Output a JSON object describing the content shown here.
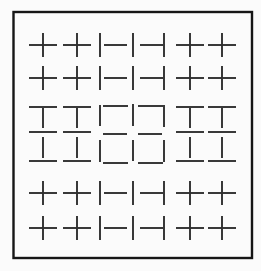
{
  "figure": {
    "background": "#fbfbfb",
    "ink": "#2f2f2f",
    "border": {
      "x": 13.5,
      "y": 12,
      "width": 238.5,
      "height": 246,
      "stroke": "#161616",
      "stroke_width": 2.4
    },
    "stroke_width": 1.9,
    "grid": {
      "rows": 6,
      "cols": 7
    },
    "cells": [
      {
        "id": "r1c1",
        "glyph": "cross",
        "strokes": [
          [
            29,
            45,
            57,
            45
          ],
          [
            43,
            33,
            43,
            57
          ]
        ]
      },
      {
        "id": "r1c2",
        "glyph": "cross",
        "strokes": [
          [
            63,
            45,
            91,
            45
          ],
          [
            77,
            33,
            77,
            57
          ]
        ]
      },
      {
        "id": "r1c3",
        "glyph": "vbar-hbar-right",
        "strokes": [
          [
            100,
            33,
            100,
            57
          ],
          [
            104,
            45,
            127,
            45
          ]
        ]
      },
      {
        "id": "r1c4",
        "glyph": "vbar",
        "strokes": [
          [
            133,
            33,
            133,
            57
          ]
        ]
      },
      {
        "id": "r1c5",
        "glyph": "hbar-vbar-right",
        "strokes": [
          [
            140,
            45,
            163,
            45
          ],
          [
            164,
            33,
            164,
            57
          ]
        ]
      },
      {
        "id": "r1c6",
        "glyph": "cross",
        "strokes": [
          [
            176,
            45,
            204,
            45
          ],
          [
            190,
            33,
            190,
            57
          ]
        ]
      },
      {
        "id": "r1c7",
        "glyph": "cross",
        "strokes": [
          [
            208,
            45,
            236,
            45
          ],
          [
            222,
            33,
            222,
            57
          ]
        ]
      },
      {
        "id": "r2c1",
        "glyph": "cross",
        "strokes": [
          [
            29,
            78,
            57,
            78
          ],
          [
            43,
            66,
            43,
            90
          ]
        ]
      },
      {
        "id": "r2c2",
        "glyph": "cross",
        "strokes": [
          [
            63,
            78,
            91,
            78
          ],
          [
            77,
            66,
            77,
            90
          ]
        ]
      },
      {
        "id": "r2c3",
        "glyph": "vbar-hbar-right",
        "strokes": [
          [
            100,
            66,
            100,
            90
          ],
          [
            104,
            78,
            127,
            78
          ]
        ]
      },
      {
        "id": "r2c4",
        "glyph": "vbar",
        "strokes": [
          [
            133,
            66,
            133,
            90
          ]
        ]
      },
      {
        "id": "r2c5",
        "glyph": "hbar-vbar-right",
        "strokes": [
          [
            140,
            78,
            163,
            78
          ],
          [
            164,
            66,
            164,
            90
          ]
        ]
      },
      {
        "id": "r2c6",
        "glyph": "cross",
        "strokes": [
          [
            176,
            78,
            204,
            78
          ],
          [
            190,
            66,
            190,
            90
          ]
        ]
      },
      {
        "id": "r2c7",
        "glyph": "cross",
        "strokes": [
          [
            208,
            78,
            236,
            78
          ],
          [
            222,
            66,
            222,
            90
          ]
        ]
      },
      {
        "id": "r3c1",
        "glyph": "tee-down",
        "strokes": [
          [
            29,
            107,
            57,
            107
          ],
          [
            43,
            108,
            43,
            128
          ]
        ]
      },
      {
        "id": "r3c2",
        "glyph": "tee-down",
        "strokes": [
          [
            63,
            107,
            91,
            107
          ],
          [
            77,
            108,
            77,
            128
          ]
        ]
      },
      {
        "id": "r3c3",
        "glyph": "corner-top-left",
        "strokes": [
          [
            100,
            105,
            100,
            126
          ],
          [
            103,
            106,
            128,
            106
          ]
        ]
      },
      {
        "id": "r3c4",
        "glyph": "vbar",
        "strokes": [
          [
            133,
            104,
            133,
            126
          ]
        ]
      },
      {
        "id": "r3c5",
        "glyph": "corner-top-right",
        "strokes": [
          [
            138,
            106,
            163,
            106
          ],
          [
            164,
            105,
            164,
            127
          ]
        ]
      },
      {
        "id": "r3c6",
        "glyph": "tee-down",
        "strokes": [
          [
            176,
            107,
            204,
            107
          ],
          [
            190,
            108,
            190,
            128
          ]
        ]
      },
      {
        "id": "r3c7",
        "glyph": "tee-down",
        "strokes": [
          [
            208,
            107,
            236,
            107
          ],
          [
            222,
            108,
            222,
            128
          ]
        ]
      },
      {
        "id": "r4c1",
        "glyph": "ibeam",
        "strokes": [
          [
            29,
            132,
            57,
            132
          ],
          [
            43,
            137,
            43,
            158
          ],
          [
            29,
            161,
            57,
            161
          ]
        ]
      },
      {
        "id": "r4c2",
        "glyph": "ibeam",
        "strokes": [
          [
            63,
            132,
            91,
            132
          ],
          [
            77,
            137,
            77,
            158
          ],
          [
            63,
            161,
            91,
            161
          ]
        ]
      },
      {
        "id": "r4c3",
        "glyph": "dash-corner-bottom-left",
        "strokes": [
          [
            103,
            134,
            127,
            134
          ],
          [
            100,
            140,
            100,
            162
          ],
          [
            103,
            163,
            128,
            163
          ]
        ]
      },
      {
        "id": "r4c4",
        "glyph": "vbar",
        "strokes": [
          [
            133,
            140,
            133,
            161
          ]
        ]
      },
      {
        "id": "r4c5",
        "glyph": "dash-corner-bottom-right",
        "strokes": [
          [
            138,
            134,
            162,
            134
          ],
          [
            164,
            140,
            164,
            162
          ],
          [
            138,
            163,
            163,
            163
          ]
        ]
      },
      {
        "id": "r4c6",
        "glyph": "ibeam",
        "strokes": [
          [
            176,
            132,
            204,
            132
          ],
          [
            190,
            137,
            190,
            158
          ],
          [
            176,
            161,
            204,
            161
          ]
        ]
      },
      {
        "id": "r4c7",
        "glyph": "ibeam",
        "strokes": [
          [
            208,
            132,
            236,
            132
          ],
          [
            222,
            137,
            222,
            158
          ],
          [
            208,
            161,
            236,
            161
          ]
        ]
      },
      {
        "id": "r5c1",
        "glyph": "cross",
        "strokes": [
          [
            29,
            193,
            57,
            193
          ],
          [
            43,
            181,
            43,
            205
          ]
        ]
      },
      {
        "id": "r5c2",
        "glyph": "cross",
        "strokes": [
          [
            63,
            193,
            91,
            193
          ],
          [
            77,
            181,
            77,
            205
          ]
        ]
      },
      {
        "id": "r5c3",
        "glyph": "vbar-hbar-right",
        "strokes": [
          [
            100,
            181,
            100,
            205
          ],
          [
            104,
            193,
            127,
            193
          ]
        ]
      },
      {
        "id": "r5c4",
        "glyph": "vbar",
        "strokes": [
          [
            133,
            181,
            133,
            205
          ]
        ]
      },
      {
        "id": "r5c5",
        "glyph": "hbar-vbar-right",
        "strokes": [
          [
            140,
            193,
            163,
            193
          ],
          [
            164,
            181,
            164,
            205
          ]
        ]
      },
      {
        "id": "r5c6",
        "glyph": "cross",
        "strokes": [
          [
            176,
            193,
            204,
            193
          ],
          [
            190,
            181,
            190,
            205
          ]
        ]
      },
      {
        "id": "r5c7",
        "glyph": "cross",
        "strokes": [
          [
            208,
            193,
            236,
            193
          ],
          [
            222,
            181,
            222,
            205
          ]
        ]
      },
      {
        "id": "r6c1",
        "glyph": "cross",
        "strokes": [
          [
            29,
            228,
            57,
            228
          ],
          [
            43,
            216,
            43,
            240
          ]
        ]
      },
      {
        "id": "r6c2",
        "glyph": "cross",
        "strokes": [
          [
            63,
            228,
            91,
            228
          ],
          [
            77,
            216,
            77,
            240
          ]
        ]
      },
      {
        "id": "r6c3",
        "glyph": "vbar-hbar-right",
        "strokes": [
          [
            100,
            216,
            100,
            240
          ],
          [
            104,
            228,
            127,
            228
          ]
        ]
      },
      {
        "id": "r6c4",
        "glyph": "vbar",
        "strokes": [
          [
            133,
            216,
            133,
            240
          ]
        ]
      },
      {
        "id": "r6c5",
        "glyph": "hbar-vbar-right",
        "strokes": [
          [
            140,
            228,
            163,
            228
          ],
          [
            164,
            216,
            164,
            240
          ]
        ]
      },
      {
        "id": "r6c6",
        "glyph": "cross",
        "strokes": [
          [
            176,
            228,
            204,
            228
          ],
          [
            190,
            216,
            190,
            240
          ]
        ]
      },
      {
        "id": "r6c7",
        "glyph": "cross",
        "strokes": [
          [
            208,
            228,
            236,
            228
          ],
          [
            222,
            216,
            222,
            240
          ]
        ]
      }
    ]
  }
}
